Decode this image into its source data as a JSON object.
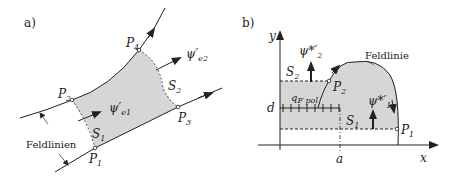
{
  "panel_a": {
    "label": "a)",
    "points": {
      "p1": "P",
      "p1_sub": "1",
      "p2": "P",
      "p2_sub": "2",
      "p3": "P",
      "p3_sub": "3",
      "p4": "P",
      "p4_sub": "4"
    },
    "surfaces": {
      "s1": "S",
      "s1_sub": "1",
      "s2": "S",
      "s2_sub": "2"
    },
    "flux": {
      "e1": "ψ′",
      "e1_sub": "e1",
      "e2": "ψ′",
      "e2_sub": "e2"
    },
    "field_lines_label": "Feldlinien",
    "colors": {
      "fill": "#d6d6d6",
      "line": "#222222"
    }
  },
  "panel_b": {
    "label": "b)",
    "axes": {
      "x": "x",
      "y": "y",
      "a": "a",
      "d": "d"
    },
    "points": {
      "p1": "P",
      "p1_sub": "1",
      "p2": "P",
      "p2_sub": "2"
    },
    "surfaces": {
      "s1": "S",
      "s1_sub": "1",
      "s2": "S",
      "s2_sub": "2"
    },
    "flux": {
      "f1": "ψ*′",
      "f1_sub": "1",
      "f2": "ψ*′",
      "f2_sub": "2"
    },
    "charge": "q",
    "charge_sub": "F pol",
    "field_line_label": "Feldlinie",
    "colors": {
      "fill": "#d6d6d6",
      "line": "#222222"
    }
  }
}
